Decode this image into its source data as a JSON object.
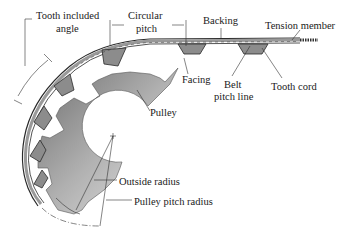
{
  "diagram": {
    "type": "labeled technical illustration",
    "colors": {
      "line": "#2a2a2a",
      "belt_fill": "#9a9a9a",
      "belt_tooth_fill": "#8c8c8c",
      "pulley_dark": "#5e5e5e",
      "pulley_light": "#e6e6e6",
      "background": "#ffffff"
    },
    "labels": {
      "tooth_angle_line1": "Tooth included",
      "tooth_angle_line2": "angle",
      "circular_pitch_line1": "Circular",
      "circular_pitch_line2": "pitch",
      "backing": "Backing",
      "tension_member": "Tension member",
      "facing": "Facing",
      "belt_pitch_line1": "Belt",
      "belt_pitch_line2": "pitch line",
      "tooth_cord": "Tooth cord",
      "pulley": "Pulley",
      "outside_radius": "Outside radius",
      "pulley_pitch_radius": "Pulley pitch radius"
    }
  }
}
